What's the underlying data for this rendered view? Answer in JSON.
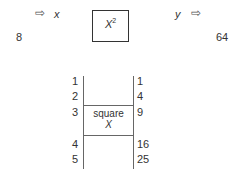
{
  "top": {
    "input_value": "8",
    "input_var": "x",
    "function_base": "X",
    "function_exp": "2",
    "output_var": "y",
    "output_value": "64",
    "arrow_icon": "⇨"
  },
  "table": {
    "inputs": [
      "1",
      "2",
      "3",
      "4",
      "5"
    ],
    "outputs": [
      "1",
      "4",
      "9",
      "16",
      "25"
    ],
    "machine_label_line1": "square",
    "machine_label_line2": "X"
  }
}
